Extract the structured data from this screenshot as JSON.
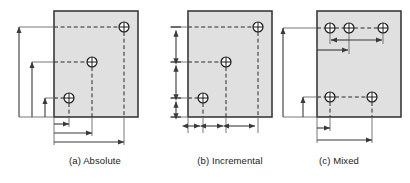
{
  "figure": {
    "panels": [
      {
        "id": "a",
        "caption": "(a) Absolute",
        "dimensioning_mode": "absolute",
        "plate": {
          "x": 54,
          "y": 11,
          "width": 84,
          "height": 106
        },
        "holes": [
          {
            "name": "hole-top-right",
            "cx": 124,
            "cy": 27
          },
          {
            "name": "hole-middle",
            "cx": 92,
            "cy": 62
          },
          {
            "name": "hole-bottom-left",
            "cx": 69,
            "cy": 98
          }
        ],
        "vertical_dimensions": [
          {
            "name": "vdim-tall",
            "x": 19,
            "from_y": 117,
            "to_y": 27
          },
          {
            "name": "vdim-medium",
            "x": 32,
            "from_y": 117,
            "to_y": 62
          },
          {
            "name": "vdim-short",
            "x": 45,
            "from_y": 117,
            "to_y": 98
          }
        ],
        "horizontal_dimensions": [
          {
            "name": "hdim-short",
            "y": 124,
            "from_x": 54,
            "to_x": 69
          },
          {
            "name": "hdim-medium",
            "y": 133,
            "from_x": 54,
            "to_x": 92
          },
          {
            "name": "hdim-long",
            "y": 142,
            "from_x": 54,
            "to_x": 124
          }
        ]
      },
      {
        "id": "b",
        "caption": "(b) Incremental",
        "dimensioning_mode": "incremental",
        "plate": {
          "x": 188,
          "y": 11,
          "width": 84,
          "height": 106
        },
        "holes": [
          {
            "name": "hole-top-right",
            "cx": 258,
            "cy": 27
          },
          {
            "name": "hole-middle",
            "cx": 226,
            "cy": 62
          },
          {
            "name": "hole-bottom-left",
            "cx": 203,
            "cy": 98
          }
        ],
        "vertical_chain": {
          "name": "vdim-chain",
          "x": 176,
          "stops": [
            117,
            98,
            62,
            27
          ]
        },
        "horizontal_chain": {
          "name": "hdim-chain",
          "y": 126,
          "stops": [
            188,
            203,
            226,
            258
          ]
        }
      },
      {
        "id": "c",
        "caption": "(c) Mixed",
        "dimensioning_mode": "mixed",
        "plate": {
          "x": 317,
          "y": 11,
          "width": 84,
          "height": 106
        },
        "holes": [
          {
            "name": "hole-top-left",
            "cx": 330,
            "cy": 28
          },
          {
            "name": "hole-top-middle",
            "cx": 349,
            "cy": 28
          },
          {
            "name": "hole-top-right",
            "cx": 383,
            "cy": 28
          },
          {
            "name": "hole-bottom-left",
            "cx": 330,
            "cy": 97
          },
          {
            "name": "hole-bottom-right",
            "cx": 372,
            "cy": 97
          }
        ],
        "vertical_dimensions": [
          {
            "name": "vdim-tall",
            "x": 283,
            "from_y": 117,
            "to_y": 28
          },
          {
            "name": "vdim-short",
            "x": 303,
            "from_y": 117,
            "to_y": 97
          }
        ],
        "inner_incremental_dimensions": [
          {
            "name": "hdim-inner-increment-1",
            "y": 40,
            "from_x": 349,
            "to_x": 330
          },
          {
            "name": "hdim-inner-increment-2",
            "y": 40,
            "from_x": 349,
            "to_x": 383
          }
        ],
        "inner_absolute_dimensions": [
          {
            "name": "hdim-inner-absolute",
            "y": 50,
            "from_x": 317,
            "to_x": 349
          }
        ],
        "horizontal_dimensions": [
          {
            "name": "hdim-short",
            "y": 128,
            "from_x": 317,
            "to_x": 330
          },
          {
            "name": "hdim-long",
            "y": 140,
            "from_x": 317,
            "to_x": 372
          }
        ]
      }
    ],
    "style": {
      "plate_fill": "#e0e0e0",
      "plate_stroke": "#3a3a3a",
      "dimension_stroke": "#4a4a4a",
      "hole_stroke": "#1a1a1a",
      "dashed_stroke": "#2b2b2b",
      "caption_color": "#1a1a1a",
      "background": "#ffffff"
    }
  }
}
